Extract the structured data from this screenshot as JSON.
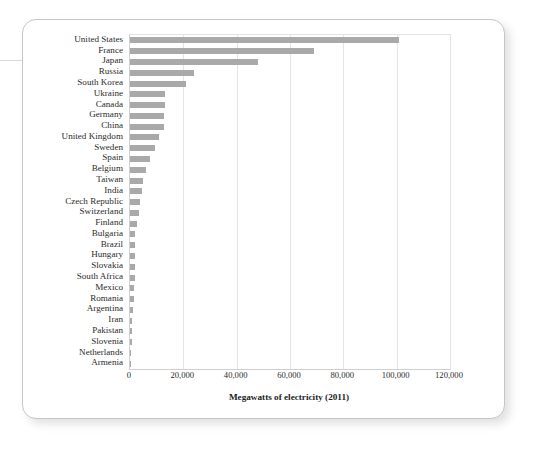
{
  "chart_data": {
    "type": "bar",
    "orientation": "horizontal",
    "title": "",
    "xlabel": "Megawatts of electricity (2011)",
    "ylabel": "",
    "xlim": [
      0,
      120000
    ],
    "xticks": [
      0,
      20000,
      40000,
      60000,
      80000,
      100000,
      120000
    ],
    "xtick_labels": [
      "0",
      "20,000",
      "40,000",
      "60,000",
      "80,000",
      "100,000",
      "120,000"
    ],
    "grid": "vertical",
    "legend": "none",
    "bar_color": "#a9a9a9",
    "categories": [
      "United States",
      "France",
      "Japan",
      "Russia",
      "South Korea",
      "Ukraine",
      "Canada",
      "Germany",
      "China",
      "United Kingdom",
      "Sweden",
      "Spain",
      "Belgium",
      "Taiwan",
      "India",
      "Czech Republic",
      "Switzerland",
      "Finland",
      "Bulgaria",
      "Brazil",
      "Hungary",
      "Slovakia",
      "South Africa",
      "Mexico",
      "Romania",
      "Argentina",
      "Iran",
      "Pakistan",
      "Slovenia",
      "Netherlands",
      "Armenia"
    ],
    "values": [
      101000,
      69000,
      48000,
      24000,
      21000,
      13100,
      13000,
      12700,
      12800,
      10700,
      9400,
      7500,
      5900,
      5000,
      4400,
      3900,
      3300,
      2700,
      2000,
      1900,
      1900,
      1800,
      1800,
      1600,
      1400,
      1000,
      900,
      700,
      700,
      500,
      375
    ]
  }
}
